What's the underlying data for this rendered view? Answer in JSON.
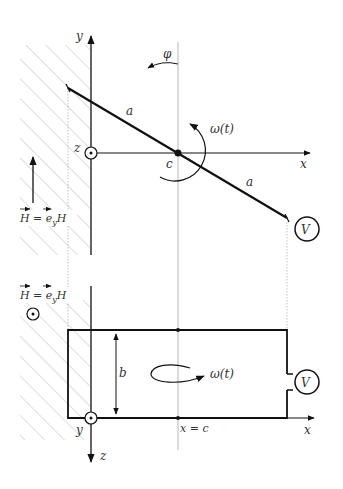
{
  "figure": {
    "type": "physics-diagram",
    "top_view": {
      "axes": {
        "y_label": "y",
        "x_label": "x",
        "z_label": "z"
      },
      "rod_segment_labels": [
        "a",
        "a"
      ],
      "pivot_label": "c",
      "angle_label": "φ",
      "angular_velocity_label": "ω(t)",
      "voltmeter_label": "V",
      "field_label": "H = e_y H",
      "field_label_parts": {
        "H": "H",
        "eq": " = ",
        "e": "e",
        "sub": "y",
        "H2": "H"
      }
    },
    "side_view": {
      "axes": {
        "x_label": "x",
        "z_label": "z",
        "y_label": "y"
      },
      "height_label": "b",
      "position_label": "x = c",
      "angular_velocity_label": "ω(t)",
      "voltmeter_label": "V",
      "field_label_parts": {
        "H": "H",
        "eq": " = ",
        "e": "e",
        "sub": "y",
        "H2": "H"
      }
    },
    "colors": {
      "line": "#111111",
      "hatch": "#aaaaaa",
      "guide": "#999999",
      "text": "#333333"
    }
  }
}
